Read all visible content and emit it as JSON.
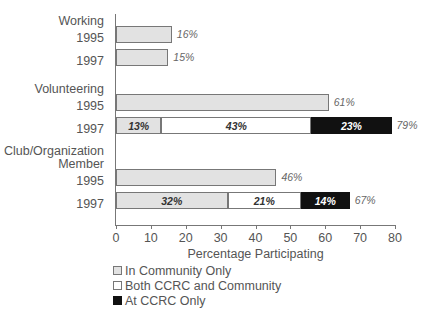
{
  "chart_data": {
    "type": "bar",
    "orientation": "horizontal",
    "stacked": true,
    "title": "",
    "xlabel": "Percentage Participating",
    "ylabel": "",
    "xlim": [
      0,
      80
    ],
    "xticks": [
      0,
      10,
      20,
      30,
      40,
      50,
      60,
      70,
      80
    ],
    "xtick_labels": [
      "0",
      "10",
      "20",
      "30",
      "40",
      "50",
      "60",
      "70",
      "80"
    ],
    "grid": false,
    "legend_position": "below-left",
    "legend": [
      "In Community Only",
      "Both CCRC and Community",
      "At CCRC Only"
    ],
    "series": [
      {
        "name": "In Community Only",
        "color": "#e2e2e2"
      },
      {
        "name": "Both CCRC and Community",
        "color": "#ffffff"
      },
      {
        "name": "At CCRC Only",
        "color": "#111111"
      }
    ],
    "groups": [
      {
        "label": "Working",
        "rows": [
          {
            "year": "1995",
            "values": [
              16,
              null,
              null
            ],
            "segment_labels": [
              "",
              "",
              ""
            ],
            "total": 16,
            "total_label": "16%"
          },
          {
            "year": "1997",
            "values": [
              15,
              null,
              null
            ],
            "segment_labels": [
              "",
              "",
              ""
            ],
            "total": 15,
            "total_label": "15%"
          }
        ]
      },
      {
        "label": "Volunteering",
        "rows": [
          {
            "year": "1995",
            "values": [
              61,
              null,
              null
            ],
            "segment_labels": [
              "",
              "",
              ""
            ],
            "total": 61,
            "total_label": "61%"
          },
          {
            "year": "1997",
            "values": [
              13,
              43,
              23
            ],
            "segment_labels": [
              "13%",
              "43%",
              "23%"
            ],
            "total": 79,
            "total_label": "79%"
          }
        ]
      },
      {
        "label": "Club/Organization\nMember",
        "rows": [
          {
            "year": "1995",
            "values": [
              46,
              null,
              null
            ],
            "segment_labels": [
              "",
              "",
              ""
            ],
            "total": 46,
            "total_label": "46%"
          },
          {
            "year": "1997",
            "values": [
              32,
              21,
              14
            ],
            "segment_labels": [
              "32%",
              "21%",
              "14%"
            ],
            "total": 67,
            "total_label": "67%"
          }
        ]
      }
    ]
  },
  "axis": {
    "x_title": "Percentage Participating",
    "ticks": [
      "0",
      "10",
      "20",
      "30",
      "40",
      "50",
      "60",
      "70",
      "80"
    ]
  },
  "legend": {
    "items": [
      {
        "label": "In Community Only",
        "swatch": "light-gray"
      },
      {
        "label": "Both CCRC and Community",
        "swatch": "white"
      },
      {
        "label": "At CCRC Only",
        "swatch": "black"
      }
    ]
  },
  "labels": {
    "group_working": "Working",
    "group_volunteering": "Volunteering",
    "group_club": "Club/Organization\nMember",
    "year_1995": "1995",
    "year_1997": "1997"
  }
}
